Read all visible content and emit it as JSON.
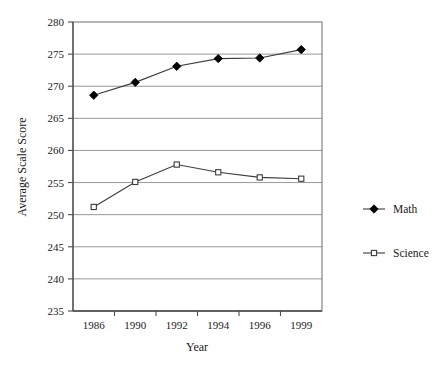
{
  "chart_data": {
    "type": "line",
    "title": "",
    "xlabel": "Year",
    "ylabel": "Average Scale Score",
    "categories": [
      "1986",
      "1990",
      "1992",
      "1994",
      "1996",
      "1999"
    ],
    "ylim": [
      235,
      280
    ],
    "yticks": [
      235,
      240,
      245,
      250,
      255,
      260,
      265,
      270,
      275,
      280
    ],
    "ytick_labels": [
      "235",
      "240",
      "245",
      "250",
      "255",
      "260",
      "265",
      "270",
      "275",
      "280"
    ],
    "grid": true,
    "legend_position": "right",
    "series": [
      {
        "name": "Math",
        "marker": "filled-diamond",
        "color": "#000000",
        "values": [
          268.6,
          270.6,
          273.1,
          274.3,
          274.4,
          275.7
        ]
      },
      {
        "name": "Science",
        "marker": "open-square",
        "color": "#3c3c3c",
        "values": [
          251.2,
          255.1,
          257.8,
          256.6,
          255.8,
          255.6
        ]
      }
    ]
  },
  "legend": {
    "items": [
      {
        "label": "Math",
        "marker": "filled-diamond"
      },
      {
        "label": "Science",
        "marker": "open-square"
      }
    ]
  }
}
